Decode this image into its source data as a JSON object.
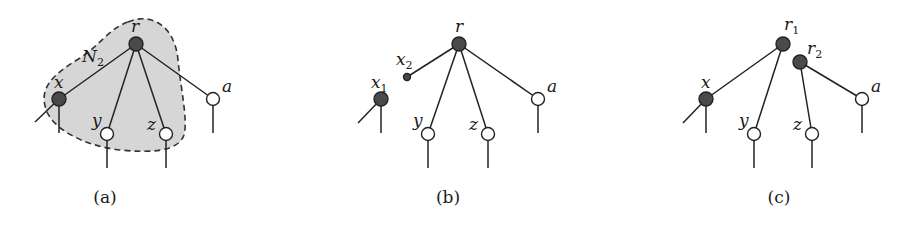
{
  "figure": {
    "panels": [
      {
        "id": "a",
        "caption": "(a)",
        "region_label": "N",
        "region_label_sub": "2",
        "nodes": {
          "r": {
            "label": "r",
            "sub": "",
            "type": "filled"
          },
          "x": {
            "label": "x",
            "sub": "",
            "type": "filled"
          },
          "y": {
            "label": "y",
            "sub": "",
            "type": "open"
          },
          "z": {
            "label": "z",
            "sub": "",
            "type": "open"
          },
          "a": {
            "label": "a",
            "sub": "",
            "type": "open"
          }
        }
      },
      {
        "id": "b",
        "caption": "(b)",
        "nodes": {
          "r": {
            "label": "r",
            "sub": "",
            "type": "filled"
          },
          "x1": {
            "label": "x",
            "sub": "1",
            "type": "filled"
          },
          "x2": {
            "label": "x",
            "sub": "2",
            "type": "small-filled"
          },
          "y": {
            "label": "y",
            "sub": "",
            "type": "open"
          },
          "z": {
            "label": "z",
            "sub": "",
            "type": "open"
          },
          "a": {
            "label": "a",
            "sub": "",
            "type": "open"
          }
        }
      },
      {
        "id": "c",
        "caption": "(c)",
        "nodes": {
          "r1": {
            "label": "r",
            "sub": "1",
            "type": "filled"
          },
          "r2": {
            "label": "r",
            "sub": "2",
            "type": "filled"
          },
          "x": {
            "label": "x",
            "sub": "",
            "type": "filled"
          },
          "y": {
            "label": "y",
            "sub": "",
            "type": "open"
          },
          "z": {
            "label": "z",
            "sub": "",
            "type": "open"
          },
          "a": {
            "label": "a",
            "sub": "",
            "type": "open"
          }
        }
      }
    ],
    "colors": {
      "filled_node": "#4a4a4a",
      "open_node": "#ffffff",
      "region_fill": "#d6d6d6",
      "stroke": "#222222"
    }
  }
}
